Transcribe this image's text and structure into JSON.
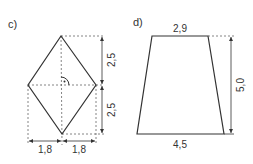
{
  "figures": [
    {
      "label": "c)",
      "shape": "rhombus",
      "dimensions": {
        "upper_half_height": "2,5",
        "lower_half_height": "2,5",
        "left_half_width": "1,8",
        "right_half_width": "1,8"
      },
      "right_angle_marker": true
    },
    {
      "label": "d)",
      "shape": "trapezoid",
      "dimensions": {
        "top": "2,9",
        "bottom": "4,5",
        "height": "5,0"
      }
    }
  ],
  "colors": {
    "stroke": "#333333",
    "dashed": "#666666"
  }
}
